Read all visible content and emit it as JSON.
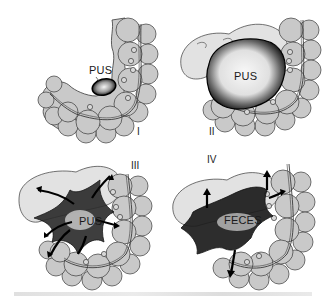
{
  "figure": {
    "panels": [
      {
        "id": "I",
        "numeral": "I",
        "label": "PUS",
        "stage": "localized abscess"
      },
      {
        "id": "II",
        "numeral": "II",
        "label": "PUS",
        "stage": "large abscess"
      },
      {
        "id": "III",
        "numeral": "III",
        "label": "PUS",
        "stage": "purulent peritonitis spreading"
      },
      {
        "id": "IV",
        "numeral": "IV",
        "label": "FECES",
        "stage": "fecal peritonitis spreading"
      }
    ],
    "colors": {
      "bowel_fill": "#c9c9c9",
      "outline": "#3a3a3a",
      "abscess_dark": "#111111",
      "abscess_light": "#efefef"
    }
  }
}
